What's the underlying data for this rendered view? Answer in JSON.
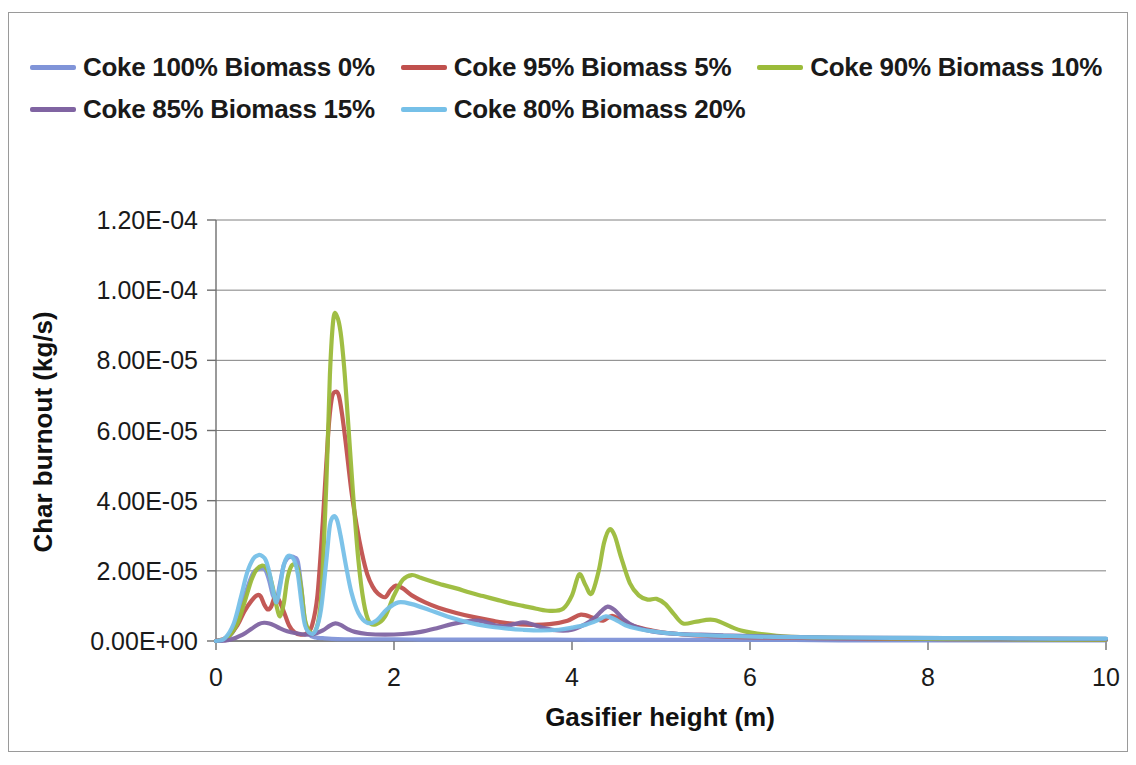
{
  "chart_data": {
    "type": "line",
    "title": "",
    "xlabel": "Gasifier height (m)",
    "ylabel": "Char burnout (kg/s)",
    "xlim": [
      0,
      10
    ],
    "ylim": [
      0,
      0.00012
    ],
    "xticks": [
      "0",
      "2",
      "4",
      "6",
      "8",
      "10"
    ],
    "xtick_values": [
      0,
      2,
      4,
      6,
      8,
      10
    ],
    "yticks": [
      "0.00E+00",
      "2.00E-05",
      "4.00E-05",
      "6.00E-05",
      "8.00E-05",
      "1.00E-04",
      "1.20E-04"
    ],
    "ytick_values": [
      0,
      2e-05,
      4e-05,
      6e-05,
      8e-05,
      0.0001,
      0.00012
    ],
    "grid": "horizontal",
    "legend_position": "top",
    "series": [
      {
        "name": "Coke 100% Biomass 0%",
        "color": "#8094d8",
        "x": [
          0.0,
          0.1,
          0.2,
          0.28,
          0.35,
          0.42,
          0.48,
          0.52,
          0.56,
          0.6,
          0.64,
          0.68,
          0.72,
          0.76,
          0.8,
          0.84,
          0.88,
          0.92,
          0.96,
          1.0,
          1.05,
          1.12,
          1.2,
          1.3,
          1.45,
          1.6,
          1.8,
          2.0,
          2.3,
          2.6,
          3.0,
          3.4,
          3.8,
          4.2,
          4.6,
          5.0,
          5.5,
          6.0,
          6.5,
          7.0,
          7.5,
          8.0,
          8.5,
          9.0,
          9.5,
          10.0
        ],
        "y": [
          0.0,
          5e-07,
          3e-06,
          9e-06,
          1.5e-05,
          1.95e-05,
          2.05e-05,
          2.08e-05,
          2e-05,
          1.7e-05,
          1.3e-05,
          1.18e-05,
          1.65e-05,
          2.15e-05,
          2.35e-05,
          2.4e-05,
          2.38e-05,
          2.25e-05,
          1.5e-05,
          5.5e-06,
          1.8e-06,
          1e-06,
          8e-07,
          6e-07,
          5e-07,
          5e-07,
          5e-07,
          5e-07,
          4e-07,
          4e-07,
          4e-07,
          4e-07,
          4e-07,
          3e-07,
          3e-07,
          3e-07,
          3e-07,
          3e-07,
          3e-07,
          2e-07,
          2e-07,
          2e-07,
          2e-07,
          2e-07,
          2e-07,
          2e-07
        ]
      },
      {
        "name": "Coke 95% Biomass 5%",
        "color": "#c0504d",
        "x": [
          0.0,
          0.12,
          0.24,
          0.32,
          0.4,
          0.46,
          0.5,
          0.54,
          0.58,
          0.62,
          0.66,
          0.7,
          0.76,
          0.82,
          0.88,
          0.95,
          1.02,
          1.08,
          1.14,
          1.2,
          1.26,
          1.3,
          1.34,
          1.38,
          1.42,
          1.46,
          1.52,
          1.58,
          1.64,
          1.7,
          1.76,
          1.82,
          1.9,
          1.96,
          2.02,
          2.1,
          2.2,
          2.35,
          2.5,
          2.7,
          2.9,
          3.1,
          3.3,
          3.55,
          3.75,
          3.95,
          4.1,
          4.25,
          4.35,
          4.45,
          4.55,
          4.7,
          4.9,
          5.1,
          5.4,
          5.8,
          6.2,
          6.8,
          7.4,
          8.0,
          8.6,
          9.2,
          10.0
        ],
        "y": [
          0.0,
          1e-06,
          4.5e-06,
          8.5e-06,
          1.15e-05,
          1.3e-05,
          1.28e-05,
          1.05e-05,
          9e-06,
          9.8e-06,
          1.25e-05,
          1.2e-05,
          8.5e-06,
          4.5e-06,
          2.5e-06,
          1.8e-06,
          2.2e-06,
          4.5e-06,
          1.3e-05,
          3.4e-05,
          5.9e-05,
          6.9e-05,
          7.1e-05,
          7e-05,
          6.4e-05,
          5.6e-05,
          4.3e-05,
          3.3e-05,
          2.5e-05,
          1.9e-05,
          1.55e-05,
          1.35e-05,
          1.25e-05,
          1.45e-05,
          1.58e-05,
          1.5e-05,
          1.3e-05,
          1.1e-05,
          9.5e-06,
          8e-06,
          6.8e-06,
          5.8e-06,
          5e-06,
          4.6e-06,
          4.8e-06,
          5.8e-06,
          7.5e-06,
          6.5e-06,
          5.8e-06,
          7.2e-06,
          6e-06,
          4.2e-06,
          3e-06,
          2.2e-06,
          1.6e-06,
          1.2e-06,
          1e-06,
          8e-07,
          7e-07,
          6e-07,
          5e-07,
          5e-07,
          4e-07
        ]
      },
      {
        "name": "Coke 90% Biomass 10%",
        "color": "#9bbb3a",
        "x": [
          0.0,
          0.12,
          0.24,
          0.32,
          0.4,
          0.46,
          0.52,
          0.56,
          0.6,
          0.64,
          0.68,
          0.72,
          0.76,
          0.8,
          0.84,
          0.88,
          0.92,
          0.96,
          1.0,
          1.06,
          1.12,
          1.18,
          1.24,
          1.28,
          1.32,
          1.36,
          1.4,
          1.44,
          1.48,
          1.54,
          1.6,
          1.66,
          1.72,
          1.8,
          1.9,
          2.0,
          2.1,
          2.2,
          2.3,
          2.4,
          2.55,
          2.7,
          2.85,
          3.0,
          3.15,
          3.3,
          3.45,
          3.6,
          3.75,
          3.9,
          4.0,
          4.08,
          4.15,
          4.22,
          4.3,
          4.36,
          4.42,
          4.48,
          4.55,
          4.65,
          4.75,
          4.85,
          4.95,
          5.05,
          5.15,
          5.25,
          5.4,
          5.6,
          5.9,
          6.3,
          6.8,
          7.4,
          8.0,
          8.8,
          9.5,
          10.0
        ],
        "y": [
          0.0,
          8e-07,
          5e-06,
          1.1e-05,
          1.75e-05,
          2.05e-05,
          2.15e-05,
          2.1e-05,
          1.9e-05,
          1.5e-05,
          1e-05,
          7e-06,
          1.05e-05,
          1.75e-05,
          2.1e-05,
          2.18e-05,
          2.05e-05,
          1.45e-05,
          6e-06,
          2.5e-06,
          3e-06,
          1.2e-05,
          4.5e-05,
          7.6e-05,
          9.2e-05,
          9.25e-05,
          8.8e-05,
          7.8e-05,
          6.4e-05,
          4.2e-05,
          2.3e-05,
          1.1e-05,
          5.5e-06,
          4.8e-06,
          7e-06,
          1.3e-05,
          1.75e-05,
          1.88e-05,
          1.8e-05,
          1.72e-05,
          1.6e-05,
          1.5e-05,
          1.38e-05,
          1.28e-05,
          1.18e-05,
          1.08e-05,
          1e-05,
          9.2e-06,
          8.6e-06,
          9.2e-06,
          1.3e-05,
          1.9e-05,
          1.6e-05,
          1.35e-05,
          2e-05,
          2.8e-05,
          3.18e-05,
          3e-05,
          2.4e-05,
          1.65e-05,
          1.3e-05,
          1.18e-05,
          1.2e-05,
          1.05e-05,
          7.5e-06,
          5e-06,
          5.5e-06,
          6e-06,
          3e-06,
          1.5e-06,
          1e-06,
          8e-07,
          6e-07,
          5e-07,
          4e-07,
          4e-07
        ]
      },
      {
        "name": "Coke 85% Biomass 15%",
        "color": "#8064a2",
        "x": [
          0.0,
          0.15,
          0.3,
          0.4,
          0.48,
          0.54,
          0.6,
          0.66,
          0.72,
          0.8,
          0.9,
          1.0,
          1.1,
          1.2,
          1.28,
          1.34,
          1.4,
          1.48,
          1.56,
          1.7,
          1.9,
          2.1,
          2.3,
          2.5,
          2.65,
          2.8,
          2.95,
          3.05,
          3.15,
          3.25,
          3.35,
          3.45,
          3.55,
          3.7,
          3.85,
          4.0,
          4.15,
          4.25,
          4.33,
          4.4,
          4.48,
          4.58,
          4.7,
          4.85,
          5.0,
          5.2,
          5.45,
          5.7,
          6.0,
          6.4,
          6.9,
          7.5,
          8.2,
          9.0,
          10.0
        ],
        "y": [
          0.0,
          3e-07,
          1.8e-06,
          3.5e-06,
          4.8e-06,
          5.2e-06,
          5e-06,
          4.4e-06,
          3.6e-06,
          2.8e-06,
          2.2e-06,
          1.8e-06,
          2e-06,
          3e-06,
          4.4e-06,
          5e-06,
          4.6e-06,
          3.4e-06,
          2.6e-06,
          2e-06,
          1.8e-06,
          2e-06,
          2.6e-06,
          3.8e-06,
          4.8e-06,
          5.5e-06,
          5.8e-06,
          5.2e-06,
          4.4e-06,
          4.2e-06,
          4.8e-06,
          5.3e-06,
          4.8e-06,
          3.6e-06,
          3e-06,
          3.2e-06,
          4.8e-06,
          6.5e-06,
          8.5e-06,
          9.8e-06,
          8.8e-06,
          6.2e-06,
          4.2e-06,
          3e-06,
          2.4e-06,
          2e-06,
          1.8e-06,
          1.6e-06,
          1.4e-06,
          1.2e-06,
          1e-06,
          9e-07,
          8e-07,
          7e-07,
          6e-07
        ]
      },
      {
        "name": "Coke 80% Biomass 20%",
        "color": "#76c0e8",
        "x": [
          0.0,
          0.1,
          0.2,
          0.28,
          0.35,
          0.42,
          0.48,
          0.52,
          0.56,
          0.6,
          0.64,
          0.68,
          0.72,
          0.76,
          0.8,
          0.84,
          0.88,
          0.92,
          0.96,
          1.0,
          1.06,
          1.12,
          1.18,
          1.24,
          1.28,
          1.32,
          1.36,
          1.4,
          1.46,
          1.52,
          1.6,
          1.7,
          1.8,
          1.92,
          2.05,
          2.2,
          2.4,
          2.6,
          2.85,
          3.05,
          3.25,
          3.45,
          3.65,
          3.85,
          4.0,
          4.15,
          4.28,
          4.38,
          4.48,
          4.6,
          4.75,
          4.95,
          5.2,
          5.5,
          5.9,
          6.4,
          7.0,
          7.6,
          8.2,
          8.8,
          9.4,
          10.0
        ],
        "y": [
          0.0,
          8e-07,
          5e-06,
          1.25e-05,
          1.95e-05,
          2.35e-05,
          2.45e-05,
          2.42e-05,
          2.3e-05,
          1.95e-05,
          1.45e-05,
          1.1e-05,
          1.55e-05,
          2.15e-05,
          2.4e-05,
          2.42e-05,
          2.3e-05,
          1.9e-05,
          1.1e-05,
          4.5e-06,
          2.2e-06,
          3e-06,
          9e-06,
          2.3e-05,
          3.3e-05,
          3.55e-05,
          3.45e-05,
          3e-05,
          2.15e-05,
          1.4e-05,
          8e-06,
          5.2e-06,
          5.8e-06,
          9e-06,
          1.1e-05,
          1.05e-05,
          8.8e-06,
          7e-06,
          5.2e-06,
          4.2e-06,
          3.6e-06,
          3.2e-06,
          3e-06,
          3.2e-06,
          3.8e-06,
          4.6e-06,
          5.8e-06,
          7e-06,
          6.2e-06,
          4.5e-06,
          3.4e-06,
          2.6e-06,
          2e-06,
          1.6e-06,
          1.3e-06,
          1.1e-06,
          1e-06,
          9e-07,
          8e-07,
          8e-07,
          7e-07,
          7e-07
        ]
      }
    ]
  },
  "legend": {
    "rows": [
      [
        {
          "label": "Coke 100% Biomass 0%",
          "color": "#8094d8"
        },
        {
          "label": "Coke 95% Biomass 5%",
          "color": "#c0504d"
        },
        {
          "label": "Coke 90% Biomass 10%",
          "color": "#9bbb3a"
        }
      ],
      [
        {
          "label": "Coke 85% Biomass 15%",
          "color": "#8064a2"
        },
        {
          "label": "Coke 80% Biomass 20%",
          "color": "#76c0e8"
        }
      ]
    ]
  },
  "axes": {
    "x_title": "Gasifier height (m)",
    "y_title": "Char burnout (kg/s)"
  }
}
